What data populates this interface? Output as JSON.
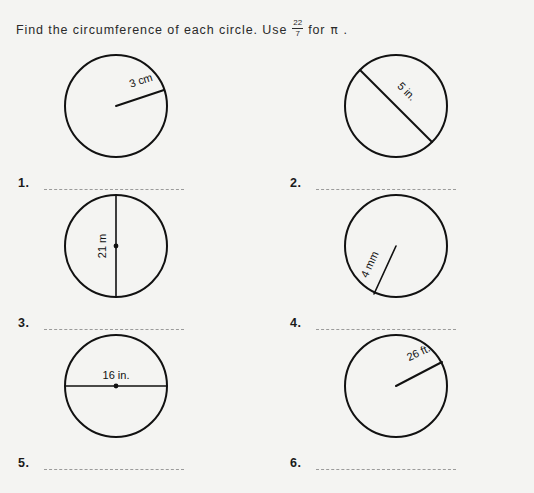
{
  "worksheet": {
    "instruction_prefix": "Find the circumference of each circle. Use",
    "fraction_numerator": "22",
    "fraction_denominator": "7",
    "instruction_suffix": "for",
    "pi_symbol": "π",
    "instruction_end": ".",
    "ink_color": "#111111",
    "paper_color": "#f4f4f2",
    "line_color": "#9b9b9b"
  },
  "problems": [
    {
      "number": "1.",
      "measure_label": "3 cm",
      "measure_type": "radius",
      "value": 3,
      "unit": "cm",
      "answer_value": ""
    },
    {
      "number": "2.",
      "measure_label": "5 in.",
      "measure_type": "diameter",
      "value": 5,
      "unit": "in.",
      "answer_value": ""
    },
    {
      "number": "3.",
      "measure_label": "21 m",
      "measure_type": "diameter",
      "value": 21,
      "unit": "m",
      "answer_value": ""
    },
    {
      "number": "4.",
      "measure_label": "4 mm",
      "measure_type": "radius",
      "value": 4,
      "unit": "mm",
      "answer_value": ""
    },
    {
      "number": "5.",
      "measure_label": "16 in.",
      "measure_type": "diameter",
      "value": 16,
      "unit": "in.",
      "answer_value": ""
    },
    {
      "number": "6.",
      "measure_label": "26 ft.",
      "measure_type": "radius",
      "value": 26,
      "unit": "ft.",
      "answer_value": ""
    }
  ]
}
